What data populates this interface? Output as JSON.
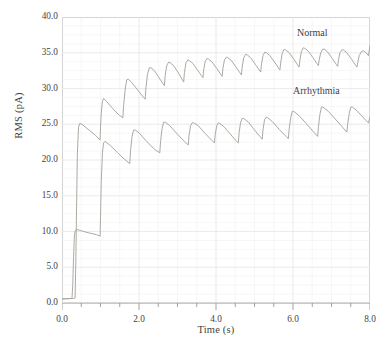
{
  "chart_data": {
    "type": "line",
    "title": "",
    "xlabel": "Time (s)",
    "ylabel": "RMS (pA)",
    "xlim": [
      0.0,
      8.0
    ],
    "ylim": [
      0.0,
      40.0
    ],
    "xticks": [
      "0.0",
      "2.0",
      "4.0",
      "6.0",
      "8.0"
    ],
    "xtick_values": [
      0.0,
      2.0,
      4.0,
      6.0,
      8.0
    ],
    "yticks": [
      "0.0",
      "5.0",
      "10.0",
      "15.0",
      "20.0",
      "25.0",
      "30.0",
      "35.0",
      "40.0"
    ],
    "ytick_values": [
      0.0,
      5.0,
      10.0,
      15.0,
      20.0,
      25.0,
      30.0,
      35.0,
      40.0
    ],
    "x_minor_step": 0.5,
    "y_minor_step": 1.25,
    "grid": true,
    "legend_position": "inline-annotations",
    "line_color": "#a9a49c",
    "grid_color": "#e8e8ea",
    "axis_color": "#c9c9c9",
    "series": [
      {
        "name": "Normal",
        "color": "#a9a49c",
        "annotation": "Normal",
        "points": [
          [
            0.0,
            0.55
          ],
          [
            0.1,
            0.6
          ],
          [
            0.22,
            0.62
          ],
          [
            0.3,
            0.65
          ],
          [
            0.34,
            0.7
          ],
          [
            0.36,
            6.2
          ],
          [
            0.38,
            14.0
          ],
          [
            0.4,
            21.0
          ],
          [
            0.43,
            24.6
          ],
          [
            0.46,
            25.1
          ],
          [
            0.52,
            25.0
          ],
          [
            0.7,
            24.2
          ],
          [
            0.86,
            23.5
          ],
          [
            0.99,
            22.8
          ],
          [
            1.0,
            24.6
          ],
          [
            1.02,
            26.6
          ],
          [
            1.05,
            28.2
          ],
          [
            1.08,
            28.6
          ],
          [
            1.14,
            28.3
          ],
          [
            1.3,
            27.3
          ],
          [
            1.46,
            26.4
          ],
          [
            1.58,
            25.9
          ],
          [
            1.6,
            27.6
          ],
          [
            1.64,
            29.8
          ],
          [
            1.68,
            31.2
          ],
          [
            1.72,
            31.3
          ],
          [
            1.8,
            30.9
          ],
          [
            1.95,
            29.9
          ],
          [
            2.08,
            29.0
          ],
          [
            2.16,
            28.5
          ],
          [
            2.18,
            30.1
          ],
          [
            2.22,
            32.0
          ],
          [
            2.27,
            32.9
          ],
          [
            2.31,
            32.9
          ],
          [
            2.4,
            32.5
          ],
          [
            2.52,
            31.5
          ],
          [
            2.62,
            30.7
          ],
          [
            2.66,
            30.4
          ],
          [
            2.68,
            31.8
          ],
          [
            2.72,
            33.2
          ],
          [
            2.77,
            33.7
          ],
          [
            2.81,
            33.6
          ],
          [
            2.9,
            33.2
          ],
          [
            3.02,
            32.2
          ],
          [
            3.12,
            31.3
          ],
          [
            3.16,
            30.9
          ],
          [
            3.18,
            32.2
          ],
          [
            3.22,
            33.6
          ],
          [
            3.27,
            34.0
          ],
          [
            3.31,
            33.9
          ],
          [
            3.4,
            33.5
          ],
          [
            3.52,
            32.6
          ],
          [
            3.62,
            31.8
          ],
          [
            3.66,
            31.5
          ],
          [
            3.68,
            32.6
          ],
          [
            3.72,
            33.8
          ],
          [
            3.77,
            34.2
          ],
          [
            3.81,
            34.1
          ],
          [
            3.9,
            33.7
          ],
          [
            4.02,
            32.8
          ],
          [
            4.12,
            32.0
          ],
          [
            4.16,
            31.7
          ],
          [
            4.18,
            32.8
          ],
          [
            4.22,
            34.0
          ],
          [
            4.27,
            34.4
          ],
          [
            4.31,
            34.3
          ],
          [
            4.4,
            33.9
          ],
          [
            4.52,
            33.0
          ],
          [
            4.62,
            32.2
          ],
          [
            4.66,
            31.9
          ],
          [
            4.68,
            33.0
          ],
          [
            4.72,
            34.3
          ],
          [
            4.77,
            34.8
          ],
          [
            4.81,
            34.7
          ],
          [
            4.9,
            34.3
          ],
          [
            5.02,
            33.4
          ],
          [
            5.12,
            32.6
          ],
          [
            5.16,
            32.3
          ],
          [
            5.18,
            33.3
          ],
          [
            5.22,
            34.6
          ],
          [
            5.27,
            35.1
          ],
          [
            5.31,
            35.0
          ],
          [
            5.4,
            34.6
          ],
          [
            5.52,
            33.7
          ],
          [
            5.62,
            32.9
          ],
          [
            5.66,
            32.6
          ],
          [
            5.68,
            33.6
          ],
          [
            5.72,
            34.9
          ],
          [
            5.77,
            35.5
          ],
          [
            5.81,
            35.4
          ],
          [
            5.9,
            35.0
          ],
          [
            6.02,
            34.1
          ],
          [
            6.12,
            33.3
          ],
          [
            6.16,
            33.0
          ],
          [
            6.18,
            34.0
          ],
          [
            6.22,
            35.2
          ],
          [
            6.27,
            35.7
          ],
          [
            6.31,
            35.6
          ],
          [
            6.4,
            35.2
          ],
          [
            6.52,
            34.3
          ],
          [
            6.62,
            33.5
          ],
          [
            6.66,
            33.2
          ],
          [
            6.68,
            34.0
          ],
          [
            6.72,
            35.0
          ],
          [
            6.77,
            35.5
          ],
          [
            6.81,
            35.5
          ],
          [
            6.9,
            35.1
          ],
          [
            7.02,
            34.2
          ],
          [
            7.12,
            33.4
          ],
          [
            7.16,
            33.1
          ],
          [
            7.18,
            34.0
          ],
          [
            7.22,
            35.0
          ],
          [
            7.27,
            35.4
          ],
          [
            7.31,
            35.4
          ],
          [
            7.4,
            35.0
          ],
          [
            7.52,
            34.1
          ],
          [
            7.62,
            33.3
          ],
          [
            7.66,
            33.0
          ],
          [
            7.68,
            33.6
          ],
          [
            7.72,
            34.6
          ],
          [
            7.78,
            35.2
          ],
          [
            7.82,
            35.3
          ],
          [
            7.9,
            35.0
          ],
          [
            7.96,
            34.6
          ],
          [
            8.0,
            36.0
          ]
        ]
      },
      {
        "name": "Arrhythmia",
        "color": "#a9a49c",
        "annotation": "Arrhythmia",
        "points": [
          [
            0.0,
            0.55
          ],
          [
            0.12,
            0.6
          ],
          [
            0.2,
            0.62
          ],
          [
            0.26,
            0.64
          ],
          [
            0.28,
            2.6
          ],
          [
            0.3,
            6.4
          ],
          [
            0.32,
            9.2
          ],
          [
            0.34,
            10.1
          ],
          [
            0.38,
            10.3
          ],
          [
            0.5,
            10.1
          ],
          [
            0.7,
            9.8
          ],
          [
            0.9,
            9.55
          ],
          [
            0.99,
            9.35
          ],
          [
            1.0,
            12.0
          ],
          [
            1.02,
            17.0
          ],
          [
            1.05,
            21.0
          ],
          [
            1.08,
            22.4
          ],
          [
            1.12,
            22.6
          ],
          [
            1.26,
            22.0
          ],
          [
            1.45,
            21.0
          ],
          [
            1.62,
            20.1
          ],
          [
            1.76,
            19.5
          ],
          [
            1.78,
            21.3
          ],
          [
            1.82,
            23.3
          ],
          [
            1.86,
            24.2
          ],
          [
            1.9,
            24.2
          ],
          [
            2.0,
            23.8
          ],
          [
            2.2,
            22.6
          ],
          [
            2.4,
            21.5
          ],
          [
            2.54,
            21.0
          ],
          [
            2.56,
            22.6
          ],
          [
            2.6,
            24.4
          ],
          [
            2.64,
            25.3
          ],
          [
            2.68,
            25.3
          ],
          [
            2.8,
            24.8
          ],
          [
            3.0,
            23.6
          ],
          [
            3.18,
            22.6
          ],
          [
            3.28,
            22.1
          ],
          [
            3.3,
            23.5
          ],
          [
            3.34,
            24.8
          ],
          [
            3.38,
            25.2
          ],
          [
            3.42,
            25.2
          ],
          [
            3.54,
            24.8
          ],
          [
            3.72,
            23.7
          ],
          [
            3.88,
            22.8
          ],
          [
            3.96,
            22.4
          ],
          [
            3.98,
            23.6
          ],
          [
            4.02,
            24.8
          ],
          [
            4.06,
            25.2
          ],
          [
            4.1,
            25.1
          ],
          [
            4.2,
            24.7
          ],
          [
            4.36,
            23.7
          ],
          [
            4.5,
            22.8
          ],
          [
            4.58,
            22.4
          ],
          [
            4.6,
            23.8
          ],
          [
            4.64,
            25.3
          ],
          [
            4.68,
            25.8
          ],
          [
            4.72,
            25.8
          ],
          [
            4.84,
            25.3
          ],
          [
            5.0,
            24.2
          ],
          [
            5.14,
            23.3
          ],
          [
            5.2,
            22.9
          ],
          [
            5.22,
            24.2
          ],
          [
            5.26,
            25.6
          ],
          [
            5.3,
            26.0
          ],
          [
            5.34,
            25.9
          ],
          [
            5.46,
            25.4
          ],
          [
            5.64,
            24.3
          ],
          [
            5.8,
            23.4
          ],
          [
            5.88,
            23.0
          ],
          [
            5.9,
            24.3
          ],
          [
            5.94,
            25.9
          ],
          [
            5.98,
            26.8
          ],
          [
            6.02,
            26.8
          ],
          [
            6.16,
            26.2
          ],
          [
            6.36,
            25.0
          ],
          [
            6.54,
            23.9
          ],
          [
            6.64,
            23.3
          ],
          [
            6.66,
            24.6
          ],
          [
            6.7,
            26.4
          ],
          [
            6.74,
            27.4
          ],
          [
            6.78,
            27.4
          ],
          [
            6.92,
            26.8
          ],
          [
            7.12,
            25.6
          ],
          [
            7.3,
            24.5
          ],
          [
            7.4,
            23.9
          ],
          [
            7.42,
            25.0
          ],
          [
            7.46,
            26.5
          ],
          [
            7.5,
            27.4
          ],
          [
            7.54,
            27.4
          ],
          [
            7.64,
            27.0
          ],
          [
            7.78,
            26.2
          ],
          [
            7.9,
            25.5
          ],
          [
            7.96,
            25.2
          ],
          [
            7.98,
            25.6
          ],
          [
            8.0,
            26.0
          ]
        ]
      }
    ]
  }
}
